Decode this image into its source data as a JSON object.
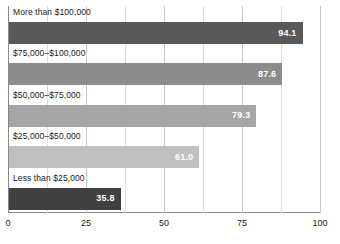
{
  "chart_data": {
    "type": "bar",
    "orientation": "horizontal",
    "title": "",
    "subtitle": "",
    "xlabel": "",
    "ylabel": "",
    "xlim": [
      0,
      100
    ],
    "xticks": [
      0,
      25,
      50,
      75,
      100
    ],
    "xticklabels": [
      "0",
      "25",
      "50",
      "75",
      "100"
    ],
    "minor_gridlines": [
      12.5,
      37.5,
      62.5,
      87.5
    ],
    "grid": true,
    "legend": "none",
    "categories": [
      "More than $100,000",
      "$75,000–$100,000",
      "$50,000–$75,000",
      "$25,000–$50,000",
      "Less than $25,000"
    ],
    "values": [
      94.1,
      87.6,
      79.3,
      61.0,
      35.8
    ],
    "value_labels": [
      "94.1",
      "87.6",
      "79.3",
      "61.0",
      "35.8"
    ],
    "bar_colors": [
      "#595959",
      "#8c8c8c",
      "#a6a6a6",
      "#bfbfbf",
      "#404040"
    ],
    "value_label_color": "#ffffff",
    "background_color": "#ffffff",
    "gridline_color": "#c9c9c9",
    "axis_color": "#8a8a8a"
  }
}
